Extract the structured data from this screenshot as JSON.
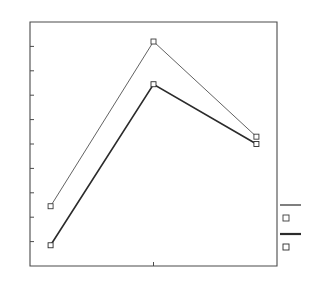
{
  "chart_data": {
    "type": "line",
    "title": "",
    "subtitle": "",
    "xlabel": "",
    "ylabel": "",
    "x": [
      1,
      2,
      3
    ],
    "categories": [
      "1",
      "2",
      "3"
    ],
    "xlim": [
      0.8,
      3.2
    ],
    "ylim": [
      0,
      10
    ],
    "xticks": [
      2
    ],
    "xticklabels": [
      ""
    ],
    "yticks": [
      1,
      2,
      3,
      4,
      5,
      6,
      7,
      8,
      9
    ],
    "yticklabels": [
      "",
      "",
      "",
      "",
      "",
      "",
      "",
      "",
      ""
    ],
    "grid": false,
    "legend_position": "right",
    "series": [
      {
        "name": "",
        "values": [
          2.45,
          9.2,
          5.3
        ],
        "color": "#3a3a3a",
        "linewidth": 0.8,
        "marker": "square-open"
      },
      {
        "name": "",
        "values": [
          0.85,
          7.45,
          5.0
        ],
        "color": "#2b2b2b",
        "linewidth": 1.6,
        "marker": "square-open"
      }
    ],
    "annotations": []
  },
  "figure": {
    "background_color": "#ffffff",
    "axes_color": "#4a4a4a",
    "plot_left": 30,
    "plot_right": 277,
    "plot_top": 22,
    "plot_bottom": 266
  },
  "legend": {
    "entries": [
      {
        "label": "",
        "marker": "square-open",
        "line_style": "thin"
      },
      {
        "label": "",
        "marker": "square-open",
        "line_style": "thick"
      }
    ],
    "x": 280,
    "y": 205
  }
}
